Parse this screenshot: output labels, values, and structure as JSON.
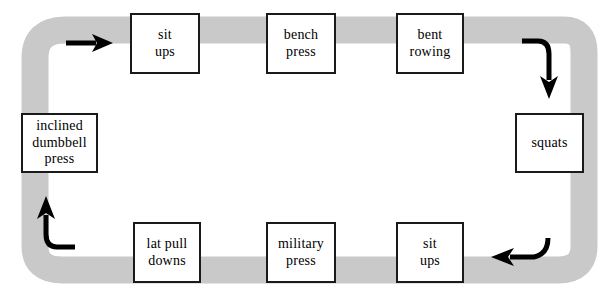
{
  "diagram": {
    "type": "cycle-flow",
    "direction": "clockwise",
    "track_color": "#c9c9c9",
    "box_border_color": "#1a1a1a",
    "box_fill_color": "#ffffff",
    "arrow_color": "#000000",
    "background_color": "#ffffff",
    "nodes": [
      {
        "id": "sit-ups-top",
        "label": "sit\nups",
        "row": "top",
        "order": 1,
        "x": 130,
        "y": 13,
        "w": 70,
        "h": 61
      },
      {
        "id": "bench-press",
        "label": "bench\npress",
        "row": "top",
        "order": 2,
        "x": 266,
        "y": 13,
        "w": 70,
        "h": 61
      },
      {
        "id": "bent-rowing",
        "label": "bent\nrowing",
        "row": "top",
        "order": 3,
        "x": 396,
        "y": 13,
        "w": 68,
        "h": 61
      },
      {
        "id": "squats",
        "label": "squats",
        "row": "right",
        "order": 4,
        "x": 515,
        "y": 113,
        "w": 69,
        "h": 60
      },
      {
        "id": "sit-ups-bottom",
        "label": "sit\nups",
        "row": "bottom",
        "order": 5,
        "x": 396,
        "y": 222,
        "w": 68,
        "h": 61
      },
      {
        "id": "military-press",
        "label": "military\npress",
        "row": "bottom",
        "order": 6,
        "x": 266,
        "y": 222,
        "w": 70,
        "h": 61
      },
      {
        "id": "lat-pull-downs",
        "label": "lat pull\ndowns",
        "row": "bottom",
        "order": 7,
        "x": 133,
        "y": 222,
        "w": 68,
        "h": 61
      },
      {
        "id": "inclined-dumbbell",
        "label": "inclined\ndumbbell\npress",
        "row": "left",
        "order": 8,
        "x": 21,
        "y": 113,
        "w": 77,
        "h": 60
      }
    ],
    "arrows": [
      {
        "id": "arrow-top-left",
        "name": "arrow-right",
        "direction": "right",
        "position": "top-left"
      },
      {
        "id": "arrow-top-right",
        "name": "arrow-curve-down",
        "direction": "down",
        "position": "top-right"
      },
      {
        "id": "arrow-bottom-right",
        "name": "arrow-curve-left",
        "direction": "left",
        "position": "bottom-right"
      },
      {
        "id": "arrow-bottom-left",
        "name": "arrow-curve-up",
        "direction": "up",
        "position": "bottom-left"
      }
    ]
  }
}
